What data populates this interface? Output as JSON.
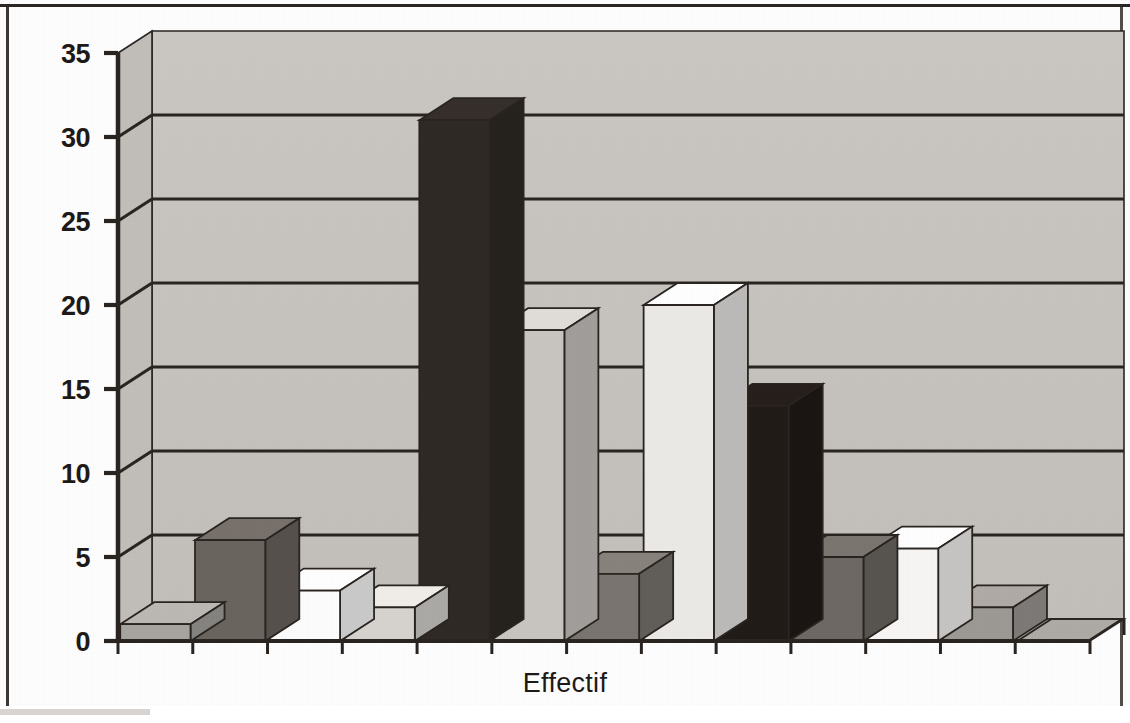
{
  "chart_data": {
    "type": "bar",
    "title": "",
    "subtitle": "",
    "xlabel": "Effectif",
    "ylabel": "",
    "ylim": [
      0,
      35
    ],
    "yticks": [
      0,
      5,
      10,
      15,
      20,
      25,
      30,
      35
    ],
    "grid": true,
    "legend": "none",
    "style": "3d-column-grayscale",
    "categories": [
      "1",
      "2",
      "3",
      "4",
      "5",
      "6",
      "7",
      "8",
      "9",
      "10",
      "11",
      "12",
      "13"
    ],
    "values": [
      1,
      6,
      3,
      2,
      31,
      18.5,
      4,
      20,
      14,
      5,
      5.5,
      2,
      0
    ],
    "series": [
      {
        "name": "Effectif",
        "values": [
          1,
          6,
          3,
          2,
          31,
          18.5,
          4,
          20,
          14,
          5,
          5.5,
          2,
          0
        ],
        "bar_colors": [
          "#a8a5a1",
          "#6b6560",
          "#fdfdfd",
          "#d7d4d0",
          "#302a26",
          "#c9c6c2",
          "#7a7570",
          "#eceae7",
          "#221c19",
          "#6e6964",
          "#f7f6f4",
          "#9d9995",
          "#b5b2ae"
        ]
      }
    ]
  },
  "axis": {
    "y_labels": [
      "35",
      "30",
      "25",
      "20",
      "15",
      "10",
      "5",
      "0"
    ],
    "x_label": "Effectif"
  },
  "plot": {
    "wall_color": "#c8c5c1",
    "floor_color": "#b2afab",
    "line_color": "#2a2521",
    "background": "#ffffff"
  }
}
